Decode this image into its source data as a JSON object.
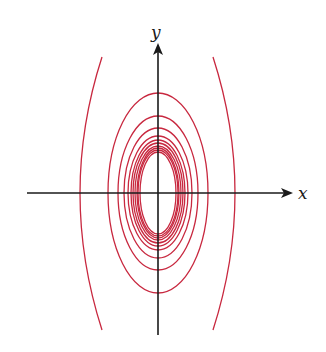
{
  "figure": {
    "curve_color": "#c8283f",
    "axis_color": "#1a1a1a",
    "center": {
      "x": 158,
      "y": 193
    },
    "x_axis": {
      "label": "x",
      "x1": 27,
      "x2": 293,
      "y": 193
    },
    "y_axis": {
      "label": "y",
      "y1": 335,
      "y2": 43,
      "x": 158
    },
    "ellipses": [
      {
        "rx": 50,
        "ry": 100
      },
      {
        "rx": 40,
        "ry": 77
      },
      {
        "rx": 34,
        "ry": 65
      },
      {
        "rx": 30,
        "ry": 57
      },
      {
        "rx": 27,
        "ry": 53
      },
      {
        "rx": 25,
        "ry": 50
      },
      {
        "rx": 23,
        "ry": 47
      },
      {
        "rx": 21,
        "ry": 45
      },
      {
        "rx": 20,
        "ry": 43
      },
      {
        "rx": 18,
        "ry": 41
      }
    ],
    "outer_arcs": [
      {
        "side": "left",
        "cross_x": 72,
        "y_top": 57,
        "y_bottom": 330
      },
      {
        "side": "right",
        "cross_x": 243,
        "y_top": 57,
        "y_bottom": 330
      }
    ]
  }
}
